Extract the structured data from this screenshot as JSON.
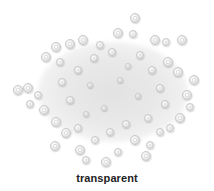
{
  "swatch": {
    "caption": "transparent",
    "colors": {
      "bead_edge": "#c9c9c9",
      "bead_fill": "#f4f4f4",
      "background": "#ffffff",
      "caption_text": "#222222"
    },
    "beads": [
      {
        "x": 135,
        "y": 18,
        "r": 5
      },
      {
        "x": 118,
        "y": 33,
        "r": 5
      },
      {
        "x": 133,
        "y": 34,
        "r": 4
      },
      {
        "x": 155,
        "y": 40,
        "r": 5
      },
      {
        "x": 166,
        "y": 42,
        "r": 4
      },
      {
        "x": 182,
        "y": 40,
        "r": 5
      },
      {
        "x": 83,
        "y": 40,
        "r": 5
      },
      {
        "x": 70,
        "y": 44,
        "r": 5
      },
      {
        "x": 56,
        "y": 47,
        "r": 5
      },
      {
        "x": 46,
        "y": 57,
        "r": 5
      },
      {
        "x": 60,
        "y": 62,
        "r": 4
      },
      {
        "x": 100,
        "y": 45,
        "r": 4
      },
      {
        "x": 168,
        "y": 62,
        "r": 5
      },
      {
        "x": 178,
        "y": 72,
        "r": 5
      },
      {
        "x": 194,
        "y": 80,
        "r": 5
      },
      {
        "x": 187,
        "y": 95,
        "r": 5
      },
      {
        "x": 190,
        "y": 107,
        "r": 4
      },
      {
        "x": 180,
        "y": 118,
        "r": 5
      },
      {
        "x": 28,
        "y": 88,
        "r": 5
      },
      {
        "x": 18,
        "y": 90,
        "r": 5
      },
      {
        "x": 38,
        "y": 95,
        "r": 4
      },
      {
        "x": 30,
        "y": 104,
        "r": 4
      },
      {
        "x": 44,
        "y": 110,
        "r": 5
      },
      {
        "x": 56,
        "y": 122,
        "r": 5
      },
      {
        "x": 66,
        "y": 133,
        "r": 5
      },
      {
        "x": 55,
        "y": 146,
        "r": 5
      },
      {
        "x": 80,
        "y": 150,
        "r": 5
      },
      {
        "x": 86,
        "y": 160,
        "r": 4
      },
      {
        "x": 106,
        "y": 162,
        "r": 5
      },
      {
        "x": 118,
        "y": 152,
        "r": 4
      },
      {
        "x": 135,
        "y": 140,
        "r": 5
      },
      {
        "x": 150,
        "y": 145,
        "r": 4
      },
      {
        "x": 146,
        "y": 156,
        "r": 5
      },
      {
        "x": 160,
        "y": 132,
        "r": 4
      },
      {
        "x": 170,
        "y": 128,
        "r": 4
      },
      {
        "x": 95,
        "y": 140,
        "r": 4
      },
      {
        "x": 78,
        "y": 128,
        "r": 4
      },
      {
        "x": 110,
        "y": 132,
        "r": 4
      },
      {
        "x": 126,
        "y": 124,
        "r": 4
      },
      {
        "x": 148,
        "y": 118,
        "r": 4
      },
      {
        "x": 70,
        "y": 100,
        "r": 4
      },
      {
        "x": 62,
        "y": 82,
        "r": 4
      },
      {
        "x": 78,
        "y": 70,
        "r": 4
      },
      {
        "x": 94,
        "y": 58,
        "r": 4
      },
      {
        "x": 112,
        "y": 52,
        "r": 4
      },
      {
        "x": 140,
        "y": 55,
        "r": 4
      },
      {
        "x": 152,
        "y": 70,
        "r": 4
      },
      {
        "x": 160,
        "y": 88,
        "r": 4
      },
      {
        "x": 165,
        "y": 104,
        "r": 4
      },
      {
        "x": 90,
        "y": 85,
        "r": 3
      },
      {
        "x": 120,
        "y": 80,
        "r": 3
      },
      {
        "x": 138,
        "y": 96,
        "r": 3
      },
      {
        "x": 104,
        "y": 108,
        "r": 3
      },
      {
        "x": 86,
        "y": 114,
        "r": 3
      },
      {
        "x": 128,
        "y": 66,
        "r": 3
      }
    ]
  }
}
